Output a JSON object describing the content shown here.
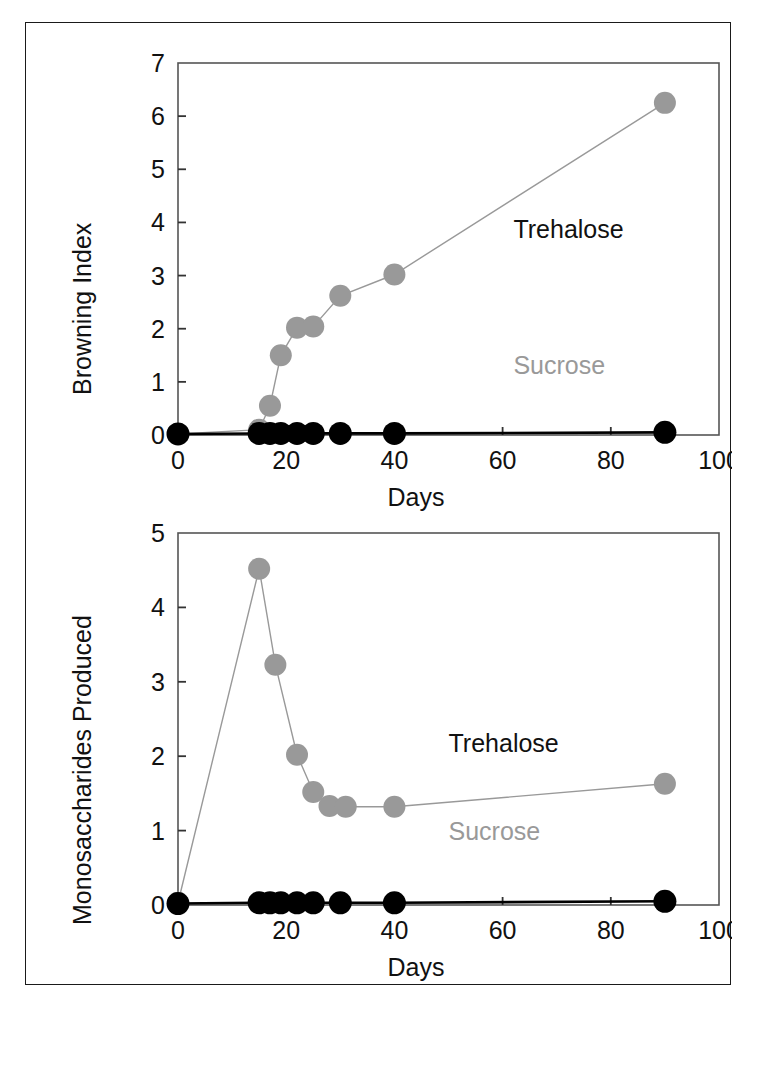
{
  "figure": {
    "background": "#ffffff",
    "border_color": "#1a1a1a",
    "series_colors": {
      "trehalose": "#999999",
      "sucrose": "#000000"
    }
  },
  "panels": [
    {
      "id": "browning-index-panel",
      "ylabel": "Browning Index",
      "xlabel": "Days",
      "x_ticks": [
        "0",
        "20",
        "40",
        "60",
        "80",
        "100"
      ],
      "y_ticks": [
        "0",
        "1",
        "2",
        "3",
        "4",
        "5",
        "6",
        "7"
      ],
      "labels": {
        "trehalose": "Trehalose",
        "sucrose": "Sucrose"
      }
    },
    {
      "id": "monosaccharides-panel",
      "ylabel": "Monosaccharides Produced",
      "xlabel": "Days",
      "x_ticks": [
        "0",
        "20",
        "40",
        "60",
        "80",
        "100"
      ],
      "y_ticks": [
        "0",
        "1",
        "2",
        "3",
        "4",
        "5"
      ],
      "labels": {
        "trehalose": "Trehalose",
        "sucrose": "Sucrose"
      }
    }
  ],
  "chart_data": [
    {
      "type": "line",
      "title": "",
      "xlabel": "Days",
      "ylabel": "Browning Index",
      "xlim": [
        0,
        100
      ],
      "ylim": [
        0,
        7
      ],
      "xticks": [
        0,
        20,
        40,
        60,
        80,
        100
      ],
      "yticks": [
        0,
        1,
        2,
        3,
        4,
        5,
        6,
        7
      ],
      "grid": false,
      "legend": "inline-annotations",
      "annotations": [
        {
          "text": "Trehalose",
          "x": 62,
          "y": 3.7,
          "color": "#111111"
        },
        {
          "text": "Sucrose",
          "x": 62,
          "y": 1.15,
          "color": "#999999"
        }
      ],
      "series": [
        {
          "name": "Trehalose",
          "color": "#999999",
          "marker": "filled-circle",
          "x": [
            0,
            15,
            17,
            19,
            22,
            25,
            30,
            40,
            90
          ],
          "y": [
            0.02,
            0.1,
            0.55,
            1.5,
            2.02,
            2.04,
            2.62,
            3.02,
            6.25
          ]
        },
        {
          "name": "Sucrose",
          "color": "#000000",
          "marker": "filled-circle",
          "x": [
            0,
            15,
            17,
            19,
            22,
            25,
            30,
            40,
            90
          ],
          "y": [
            0.02,
            0.03,
            0.03,
            0.03,
            0.03,
            0.03,
            0.03,
            0.03,
            0.05
          ]
        }
      ]
    },
    {
      "type": "line",
      "title": "",
      "xlabel": "Days",
      "ylabel": "Monosaccharides Produced",
      "xlim": [
        0,
        100
      ],
      "ylim": [
        0,
        5
      ],
      "xticks": [
        0,
        20,
        40,
        60,
        80,
        100
      ],
      "yticks": [
        0,
        1,
        2,
        3,
        4,
        5
      ],
      "grid": false,
      "legend": "inline-annotations",
      "annotations": [
        {
          "text": "Trehalose",
          "x": 50,
          "y": 2.05,
          "color": "#111111"
        },
        {
          "text": "Sucrose",
          "x": 50,
          "y": 0.88,
          "color": "#999999"
        }
      ],
      "series": [
        {
          "name": "Trehalose",
          "color": "#999999",
          "marker": "filled-circle",
          "x": [
            0,
            15,
            18,
            22,
            25,
            28,
            31,
            40,
            90
          ],
          "y": [
            0.03,
            4.52,
            3.23,
            2.02,
            1.52,
            1.33,
            1.32,
            1.32,
            1.63
          ]
        },
        {
          "name": "Sucrose",
          "color": "#000000",
          "marker": "filled-circle",
          "x": [
            0,
            15,
            17,
            19,
            22,
            25,
            30,
            40,
            90
          ],
          "y": [
            0.02,
            0.03,
            0.03,
            0.03,
            0.03,
            0.03,
            0.03,
            0.03,
            0.05
          ]
        }
      ]
    }
  ]
}
